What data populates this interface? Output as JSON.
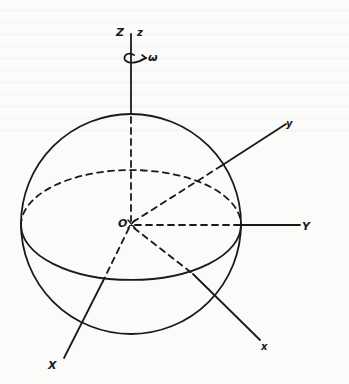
{
  "figure": {
    "colors": {
      "ink": "#1a1a1a",
      "paper": "#fbfbfa"
    },
    "sphere": {
      "cx": 131,
      "cy": 224,
      "r": 110
    },
    "equator": {
      "cx": 131,
      "cy": 225,
      "rx": 110,
      "ry": 55
    },
    "origin": {
      "label": "O",
      "x": 131,
      "y": 224
    },
    "axes": {
      "Z": {
        "label": "Z",
        "label_x": 116,
        "label_y": 36
      },
      "z": {
        "label": "z",
        "label_x": 137,
        "label_y": 36
      },
      "omega": {
        "label": "ω",
        "label_x": 148,
        "label_y": 60
      },
      "y_body": {
        "label": "y",
        "label_x": 286,
        "label_y": 127
      },
      "Y": {
        "label": "Y",
        "label_x": 302,
        "label_y": 230
      },
      "X": {
        "label": "X",
        "label_x": 48,
        "label_y": 369
      },
      "x_body": {
        "label": "x",
        "label_x": 261,
        "label_y": 350
      }
    }
  }
}
